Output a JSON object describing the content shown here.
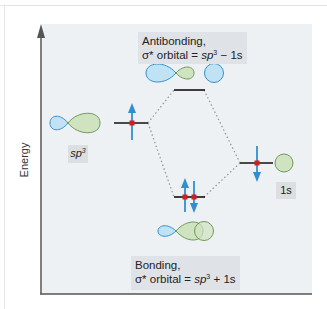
{
  "axis": {
    "y_label": "Energy"
  },
  "antibonding": {
    "title": "Antibonding,",
    "formula_prefix": "σ* orbital = ",
    "formula_term1": "sp",
    "formula_sup": "3",
    "formula_op": " − ",
    "formula_term2": "1s"
  },
  "bonding": {
    "title": "Bonding,",
    "formula_prefix": "σ* orbital = ",
    "formula_term1": "sp",
    "formula_sup": "3",
    "formula_op": " + ",
    "formula_term2": "1s"
  },
  "labels": {
    "sp3_base": "sp",
    "sp3_sup": "3",
    "s1": "1s"
  },
  "colors": {
    "lobe_blue": "#bfe3f5",
    "lobe_blue_stroke": "#3a8fc8",
    "lobe_green": "#cfe3c0",
    "lobe_green_stroke": "#6e9a5a",
    "electron_arrow": "#2f8fd0",
    "electron_dot": "#d01f1f",
    "level_line": "#111111",
    "panel_bg": "#eef1f4"
  }
}
